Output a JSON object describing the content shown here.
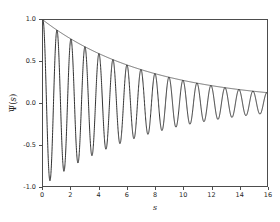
{
  "chart_data": {
    "type": "line",
    "title": "",
    "xlabel": "s",
    "ylabel": "Ψ(s)",
    "xlim": [
      0,
      16
    ],
    "ylim": [
      -1.0,
      1.0
    ],
    "xticks": [
      0,
      2,
      4,
      6,
      8,
      10,
      12,
      14,
      16
    ],
    "xtick_labels": [
      "0",
      "2",
      "4",
      "6",
      "8",
      "10",
      "12",
      "14",
      "16"
    ],
    "yticks": [
      -1.0,
      -0.5,
      0.0,
      0.5,
      1.0
    ],
    "ytick_labels": [
      "-1.0",
      "-0.5",
      "0.0",
      "0.5",
      "1.0"
    ],
    "grid": false,
    "legend": null,
    "series": [
      {
        "name": "damped-oscillation",
        "color": "#1a1a1a",
        "linewidth": 0.9,
        "formula": "exp(-0.13*s)*cos(2*pi*s)",
        "decay": 0.13,
        "angular_frequency": 6.2832,
        "period": 1.0,
        "sample_points": [
          {
            "s": 0.0,
            "y": 1.0
          },
          {
            "s": 0.5,
            "y": -0.937
          },
          {
            "s": 1.0,
            "y": 0.878
          },
          {
            "s": 1.5,
            "y": -0.822
          },
          {
            "s": 2.0,
            "y": 0.771
          },
          {
            "s": 2.5,
            "y": -0.722
          },
          {
            "s": 3.0,
            "y": 0.677
          },
          {
            "s": 3.5,
            "y": -0.634
          },
          {
            "s": 4.0,
            "y": 0.595
          },
          {
            "s": 5.0,
            "y": 0.522
          },
          {
            "s": 6.0,
            "y": 0.458
          },
          {
            "s": 7.0,
            "y": 0.403
          },
          {
            "s": 8.0,
            "y": 0.353
          },
          {
            "s": 9.0,
            "y": 0.31
          },
          {
            "s": 10.0,
            "y": 0.273
          },
          {
            "s": 11.0,
            "y": 0.239
          },
          {
            "s": 12.0,
            "y": 0.21
          },
          {
            "s": 13.0,
            "y": 0.185
          },
          {
            "s": 14.0,
            "y": 0.162
          },
          {
            "s": 15.0,
            "y": 0.142
          },
          {
            "s": 16.0,
            "y": 0.125
          }
        ]
      },
      {
        "name": "exponential-envelope",
        "color": "#4d4d4d",
        "linewidth": 0.8,
        "formula": "exp(-0.13*s)",
        "decay": 0.13,
        "sample_points": [
          {
            "s": 0,
            "y": 1.0
          },
          {
            "s": 2,
            "y": 0.771
          },
          {
            "s": 4,
            "y": 0.595
          },
          {
            "s": 6,
            "y": 0.458
          },
          {
            "s": 8,
            "y": 0.353
          },
          {
            "s": 10,
            "y": 0.273
          },
          {
            "s": 12,
            "y": 0.21
          },
          {
            "s": 14,
            "y": 0.162
          },
          {
            "s": 16,
            "y": 0.125
          }
        ]
      }
    ]
  }
}
